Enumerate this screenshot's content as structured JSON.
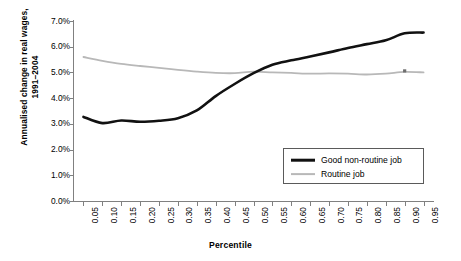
{
  "chart_data": {
    "type": "line",
    "title": "",
    "xlabel": "Percentile",
    "ylabel": "Annualised change in real wages,\n1991–2004",
    "x": [
      0.05,
      0.1,
      0.15,
      0.2,
      0.25,
      0.3,
      0.35,
      0.4,
      0.45,
      0.5,
      0.55,
      0.6,
      0.65,
      0.7,
      0.75,
      0.8,
      0.85,
      0.9,
      0.95
    ],
    "xticklabels": [
      "0.05",
      "0.10",
      "0.15",
      "0.20",
      "0.25",
      "0.30",
      "0.35",
      "0.40",
      "0.45",
      "0.50",
      "0.55",
      "0.60",
      "0.65",
      "0.70",
      "0.75",
      "0.80",
      "0.85",
      "0.90",
      "0.95"
    ],
    "yticklabels": [
      "0.0%",
      "1.0%",
      "2.0%",
      "3.0%",
      "4.0%",
      "5.0%",
      "6.0%",
      "7.0%"
    ],
    "yticks": [
      0.0,
      1.0,
      2.0,
      3.0,
      4.0,
      5.0,
      6.0,
      7.0
    ],
    "ylim": [
      0.0,
      7.0
    ],
    "xlim": [
      0.025,
      0.975
    ],
    "grid": false,
    "legend_position": "lower right",
    "series": [
      {
        "name": "Good non-routine job",
        "color": "#111111",
        "linewidth": 2.6,
        "values": [
          3.27,
          3.03,
          3.13,
          3.08,
          3.12,
          3.22,
          3.52,
          4.08,
          4.55,
          4.97,
          5.3,
          5.47,
          5.62,
          5.78,
          5.95,
          6.1,
          6.25,
          6.52,
          6.55
        ]
      },
      {
        "name": "Routine job",
        "color": "#b8b8b8",
        "linewidth": 1.8,
        "values": [
          5.6,
          5.45,
          5.33,
          5.25,
          5.18,
          5.1,
          5.03,
          4.98,
          4.97,
          5.03,
          5.0,
          4.98,
          4.95,
          4.96,
          4.95,
          4.92,
          4.95,
          5.02,
          5.0
        ]
      }
    ],
    "annotations": [
      {
        "name": "marker-dot",
        "x": 0.9,
        "y": 5.02,
        "series": "Routine job"
      }
    ]
  },
  "legend": {
    "items": [
      {
        "label": "Good non-routine job",
        "swatch": "black-line-swatch"
      },
      {
        "label": "Routine job",
        "swatch": "gray-line-swatch"
      }
    ]
  }
}
